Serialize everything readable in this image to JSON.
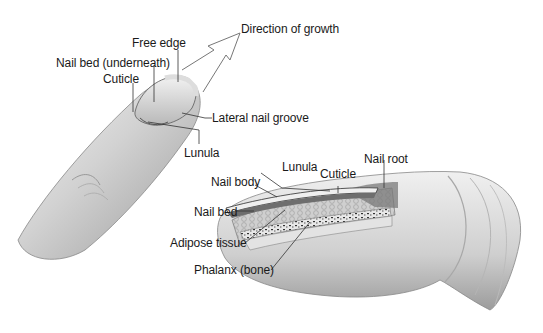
{
  "diagram": {
    "top_view": {
      "labels": {
        "direction_of_growth": "Direction of growth",
        "free_edge": "Free edge",
        "nail_bed_underneath": "Nail bed (underneath)",
        "cuticle": "Cuticle",
        "lateral_nail_groove": "Lateral nail groove",
        "lunula": "Lunula"
      }
    },
    "cross_section_view": {
      "labels": {
        "lunula": "Lunula",
        "cuticle": "Cuticle",
        "nail_root": "Nail root",
        "nail_body": "Nail body",
        "nail_bed": "Nail bed",
        "adipose_tissue": "Adipose tissue",
        "phalanx_bone": "Phalanx (bone)"
      }
    },
    "colors": {
      "skin_light": "#e6e6e6",
      "skin_mid": "#bdbdbd",
      "skin_dark": "#8a8a8a",
      "leader_line": "#333333",
      "text": "#1a1a1a"
    }
  }
}
